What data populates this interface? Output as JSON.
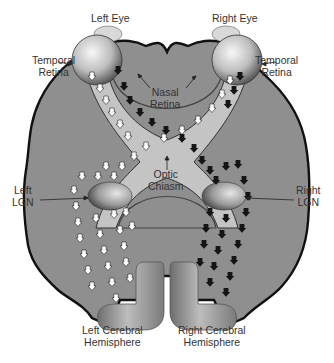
{
  "diagram": {
    "colors": {
      "background": "#ffffff",
      "brain_fill": "#8f8f8f",
      "brain_outline": "#111111",
      "optic_tract": "#c4c4c4",
      "eye_light": "#f2f2f2",
      "eye_dark": "#5a5a5a",
      "left_pathway_arrows": "#ffffff",
      "right_pathway_arrows": "#1a1a1a",
      "cortex": "#9a9a9a",
      "text": "#333333"
    },
    "labels": {
      "left_eye": "Left Eye",
      "right_eye": "Right Eye",
      "temporal_retina_left": [
        "Temporal",
        "Retina"
      ],
      "temporal_retina_right": [
        "Temporal",
        "Retina"
      ],
      "nasal_retina": [
        "Nasal",
        "Retina"
      ],
      "optic_chiasm": [
        "Optic",
        "Chiasm"
      ],
      "left_lgn": [
        "Left",
        "LGN"
      ],
      "right_lgn": [
        "Right",
        "LGN"
      ],
      "left_hemisphere": [
        "Left Cerebral",
        "Hemisphere"
      ],
      "right_hemisphere": [
        "Right Cerebral",
        "Hemisphere"
      ]
    },
    "pathways": [
      {
        "name": "left-visual-pathway",
        "arrow_color": "white",
        "route": "left eye temporal + right eye nasal → optic chiasm → left LGN → left cerebral hemisphere"
      },
      {
        "name": "right-visual-pathway",
        "arrow_color": "black",
        "route": "right eye temporal + left eye nasal → optic chiasm → right LGN → right cerebral hemisphere"
      }
    ]
  }
}
